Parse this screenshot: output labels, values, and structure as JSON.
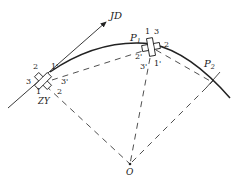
{
  "diagram": {
    "type": "curve-layout-survey",
    "points": {
      "JD": {
        "label": "JD"
      },
      "ZY": {
        "label": "ZY"
      },
      "P1": {
        "label": "P",
        "subscript": "1"
      },
      "P2": {
        "label": "P",
        "subscript": "2"
      },
      "O": {
        "label": "O"
      }
    },
    "zy_cross_labels": {
      "n1": "1",
      "n2": "2",
      "n3": "3",
      "n1p": "1'",
      "n2p": "2",
      "n3p": "3'"
    },
    "p1_cross_labels": {
      "n1": "1",
      "n3": "3",
      "n2": "2",
      "n2p": "2'",
      "n3p": "3'",
      "n1p": "1'"
    },
    "colors": {
      "line": "#222222",
      "background": "#ffffff"
    }
  }
}
